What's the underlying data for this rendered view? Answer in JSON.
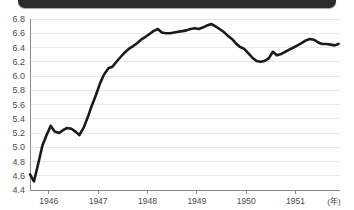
{
  "banner": {
    "text": ""
  },
  "chart_data": {
    "type": "line",
    "title": "",
    "subtitle": "",
    "xlabel": "(年)",
    "ylabel": "",
    "ylim": [
      4.4,
      6.8
    ],
    "ytick_step": 0.2,
    "ytick_labels": [
      "6.8",
      "6.6",
      "6.4",
      "6.2",
      "6.0",
      "5.8",
      "5.6",
      "5.4",
      "5.2",
      "5.0",
      "4.8",
      "4.6",
      "4.4"
    ],
    "ytick_values": [
      6.8,
      6.6,
      6.4,
      6.2,
      6.0,
      5.8,
      5.6,
      5.4,
      5.2,
      5.0,
      4.8,
      4.6,
      4.4
    ],
    "xtick_labels": [
      "1946",
      "1947",
      "1948",
      "1949",
      "1950",
      "1951"
    ],
    "xtick_values": [
      1946,
      1947,
      1948,
      1949,
      1950,
      1951
    ],
    "xlim": [
      1945.62,
      1951.9
    ],
    "grid": "horizontal",
    "legend": "none",
    "line_color": "#1a1a1a",
    "series": [
      {
        "name": "series-1",
        "x": [
          1945.62,
          1945.7,
          1945.79,
          1945.87,
          1945.96,
          1946.04,
          1946.12,
          1946.21,
          1946.29,
          1946.37,
          1946.46,
          1946.54,
          1946.62,
          1946.71,
          1946.79,
          1946.87,
          1946.96,
          1947.04,
          1947.12,
          1947.21,
          1947.29,
          1947.37,
          1947.46,
          1947.54,
          1947.62,
          1947.71,
          1947.79,
          1947.87,
          1947.96,
          1948.04,
          1948.12,
          1948.21,
          1948.29,
          1948.37,
          1948.46,
          1948.54,
          1948.62,
          1948.71,
          1948.79,
          1948.87,
          1948.96,
          1949.04,
          1949.12,
          1949.21,
          1949.29,
          1949.37,
          1949.46,
          1949.54,
          1949.62,
          1949.71,
          1949.79,
          1949.87,
          1949.96,
          1950.04,
          1950.12,
          1950.21,
          1950.29,
          1950.37,
          1950.46,
          1950.54,
          1950.62,
          1950.71,
          1950.79,
          1950.87,
          1950.96,
          1951.04,
          1951.12,
          1951.21,
          1951.29,
          1951.37,
          1951.46,
          1951.54,
          1951.62,
          1951.71,
          1951.79,
          1951.87
        ],
        "y": [
          4.62,
          4.52,
          4.78,
          5.02,
          5.18,
          5.3,
          5.22,
          5.2,
          5.24,
          5.27,
          5.26,
          5.22,
          5.17,
          5.28,
          5.42,
          5.58,
          5.74,
          5.9,
          6.02,
          6.11,
          6.13,
          6.2,
          6.27,
          6.33,
          6.38,
          6.42,
          6.46,
          6.51,
          6.55,
          6.59,
          6.63,
          6.66,
          6.61,
          6.6,
          6.6,
          6.61,
          6.62,
          6.63,
          6.64,
          6.66,
          6.67,
          6.66,
          6.68,
          6.71,
          6.73,
          6.7,
          6.66,
          6.62,
          6.57,
          6.52,
          6.46,
          6.41,
          6.38,
          6.32,
          6.26,
          6.21,
          6.2,
          6.21,
          6.25,
          6.34,
          6.29,
          6.31,
          6.34,
          6.37,
          6.4,
          6.43,
          6.46,
          6.5,
          6.52,
          6.51,
          6.47,
          6.45,
          6.45,
          6.44,
          6.43,
          6.45
        ]
      }
    ]
  }
}
